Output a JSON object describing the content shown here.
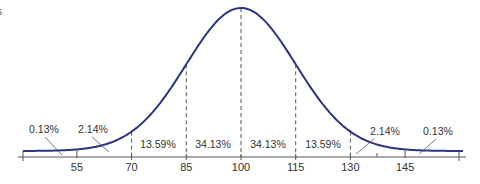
{
  "corner_fragment": "s",
  "chart_data": {
    "type": "line",
    "title": "",
    "xlabel": "",
    "ylabel": "",
    "distribution": "normal",
    "mean": 100,
    "sd": 15,
    "xlim": [
      40,
      160
    ],
    "x_ticks": [
      55,
      70,
      85,
      100,
      115,
      130,
      145
    ],
    "x_tick_labels": [
      "55",
      "70",
      "85",
      "100",
      "115",
      "130",
      "145"
    ],
    "dashed_lines_at": [
      70,
      85,
      100,
      115,
      130
    ],
    "grid": false,
    "legend": "none",
    "regions": [
      {
        "range": [
          -Infinity,
          55
        ],
        "percent": "0.13%",
        "value": 0.13
      },
      {
        "range": [
          55,
          70
        ],
        "percent": "2.14%",
        "value": 2.14
      },
      {
        "range": [
          70,
          85
        ],
        "percent": "13.59%",
        "value": 13.59
      },
      {
        "range": [
          85,
          100
        ],
        "percent": "34.13%",
        "value": 34.13
      },
      {
        "range": [
          100,
          115
        ],
        "percent": "34.13%",
        "value": 34.13
      },
      {
        "range": [
          115,
          130
        ],
        "percent": "13.59%",
        "value": 13.59
      },
      {
        "range": [
          130,
          145
        ],
        "percent": "2.14%",
        "value": 2.14
      },
      {
        "range": [
          145,
          Infinity
        ],
        "percent": "0.13%",
        "value": 0.13
      }
    ],
    "curve_color": "#2e3484",
    "axis_color": "#555555"
  }
}
